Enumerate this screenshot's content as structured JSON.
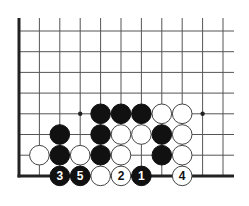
{
  "diagram": {
    "type": "go-board-corner",
    "grid": {
      "columns": 11,
      "rows": 8,
      "origin_x": 19,
      "origin_y": 31,
      "spacing_x": 20.4,
      "spacing_y": 20.7,
      "right_extent": 234,
      "top_extent": 18,
      "edges": [
        "left",
        "bottom"
      ]
    },
    "colors": {
      "line": "#555555",
      "edge": "#222222",
      "black_stone": "#111111",
      "white_stone": "#ffffff",
      "stone_outline": "#444444"
    },
    "star_points": [
      {
        "col": 3,
        "row": 4
      },
      {
        "col": 9,
        "row": 4
      }
    ],
    "stones": [
      {
        "col": 4,
        "row": 4,
        "color": "black",
        "label": ""
      },
      {
        "col": 5,
        "row": 4,
        "color": "black",
        "label": ""
      },
      {
        "col": 6,
        "row": 4,
        "color": "black",
        "label": ""
      },
      {
        "col": 7,
        "row": 4,
        "color": "white",
        "label": ""
      },
      {
        "col": 8,
        "row": 4,
        "color": "white",
        "label": ""
      },
      {
        "col": 2,
        "row": 5,
        "color": "black",
        "label": ""
      },
      {
        "col": 4,
        "row": 5,
        "color": "black",
        "label": ""
      },
      {
        "col": 5,
        "row": 5,
        "color": "white",
        "label": ""
      },
      {
        "col": 6,
        "row": 5,
        "color": "white",
        "label": ""
      },
      {
        "col": 7,
        "row": 5,
        "color": "black",
        "label": ""
      },
      {
        "col": 8,
        "row": 5,
        "color": "white",
        "label": ""
      },
      {
        "col": 1,
        "row": 6,
        "color": "white",
        "label": ""
      },
      {
        "col": 2,
        "row": 6,
        "color": "black",
        "label": ""
      },
      {
        "col": 3,
        "row": 6,
        "color": "white",
        "label": ""
      },
      {
        "col": 4,
        "row": 6,
        "color": "black",
        "label": ""
      },
      {
        "col": 5,
        "row": 6,
        "color": "white",
        "label": ""
      },
      {
        "col": 7,
        "row": 6,
        "color": "black",
        "label": ""
      },
      {
        "col": 8,
        "row": 6,
        "color": "white",
        "label": ""
      },
      {
        "col": 2,
        "row": 7,
        "color": "black",
        "label": "3"
      },
      {
        "col": 3,
        "row": 7,
        "color": "black",
        "label": "5"
      },
      {
        "col": 4,
        "row": 7,
        "color": "white",
        "label": ""
      },
      {
        "col": 5,
        "row": 7,
        "color": "white",
        "label": "2"
      },
      {
        "col": 6,
        "row": 7,
        "color": "black",
        "label": "1"
      },
      {
        "col": 8,
        "row": 7,
        "color": "white",
        "label": "4"
      }
    ]
  }
}
